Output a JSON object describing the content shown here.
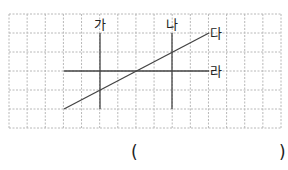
{
  "figure": {
    "grid": {
      "columns": 15,
      "rows": 6,
      "line_style": "dashed",
      "color": "#b5b5b5"
    },
    "lines": [
      {
        "id": "ga",
        "label": "가",
        "type": "vertical"
      },
      {
        "id": "na",
        "label": "나",
        "type": "vertical"
      },
      {
        "id": "da",
        "label": "다",
        "type": "diagonal"
      },
      {
        "id": "ra",
        "label": "라",
        "type": "horizontal"
      }
    ],
    "line_color": "#444444"
  },
  "answer": {
    "open_paren": "(",
    "close_paren": ")",
    "value": ""
  }
}
